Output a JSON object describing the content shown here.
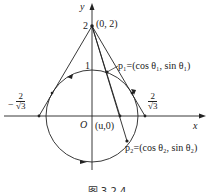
{
  "figure": {
    "caption": "图 3.2.4",
    "axes": {
      "x_label": "x",
      "y_label": "y",
      "origin_label": "O"
    },
    "labels": {
      "apex": "(0, 2)",
      "apex_y_tick": "2",
      "circle_top_tick": "1",
      "u_point": "(u,0)",
      "p1": "p₁=(cos θ₁, sin θ₁)",
      "p2": "p₂=(cos θ₂, sin θ₂)",
      "left_x_num": "2",
      "left_x_den": "√3",
      "left_x_sign": "−",
      "right_x_num": "2",
      "right_x_den": "√3"
    },
    "stroke_color": "#222222",
    "background": "#ffffff"
  }
}
